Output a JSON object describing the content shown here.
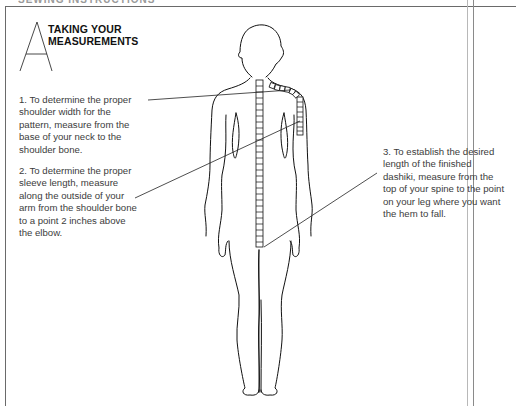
{
  "page": {
    "header_partial": "SEWING INSTRUCTIONS",
    "section_letter": "A",
    "title_line1": "TAKING YOUR",
    "title_line2": "MEASUREMENTS"
  },
  "instructions": [
    {
      "number": "1",
      "text": "1. To determine the proper\nshoulder width for the\npattern, measure from the\nbase of your neck to the\nshoulder bone."
    },
    {
      "number": "2",
      "text": "2. To determine the proper\nsleeve length, measure\nalong the outside of your\narm from the shoulder bone\nto a point 2 inches above\nthe elbow."
    },
    {
      "number": "3",
      "text": "3. To establish the desired\nlength of the finished\ndashiki, measure from the\ntop of your spine to the point\non your leg where you want\nthe hem to fall."
    }
  ],
  "illustration": {
    "subject": "back view of human figure with measuring tape",
    "colors": {
      "line": "#111111",
      "frame": "#6a6a6a",
      "text": "#3c3c3c"
    }
  }
}
